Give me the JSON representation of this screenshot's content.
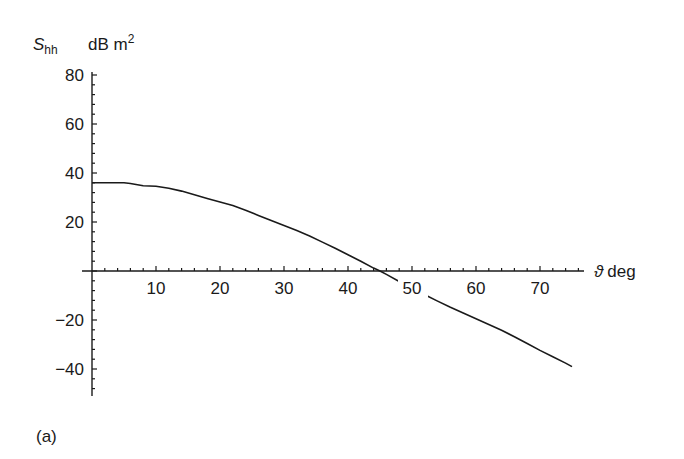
{
  "chart_data": {
    "type": "line",
    "title": "",
    "panel_label": "(a)",
    "xlabel": "ϑ deg",
    "xlabel_symbol": "ϑ",
    "xlabel_unit": "deg",
    "ylabel": "S_hh  dB m²",
    "ylabel_symbol": "S",
    "ylabel_subscript": "hh",
    "ylabel_unit": "dB m",
    "ylabel_unit_superscript": "2",
    "xlim": [
      0,
      77
    ],
    "ylim": [
      -50,
      80
    ],
    "xticks": [
      10,
      20,
      30,
      40,
      50,
      60,
      70
    ],
    "yticks": [
      80,
      60,
      40,
      20,
      -20,
      -40
    ],
    "xtick_labels": [
      "10",
      "20",
      "30",
      "40",
      "50",
      "60",
      "70"
    ],
    "ytick_labels": [
      "80",
      "60",
      "40",
      "20",
      "−20",
      "−40"
    ],
    "grid": false,
    "legend": null,
    "series": [
      {
        "name": "S_hh",
        "x": [
          0,
          2,
          4,
          5,
          6,
          8,
          10,
          12,
          14,
          16,
          18,
          20,
          22,
          24,
          26,
          28,
          30,
          32,
          34,
          36,
          38,
          40,
          42,
          44,
          45,
          46,
          48,
          50,
          52,
          54,
          56,
          58,
          60,
          62,
          64,
          66,
          68,
          70,
          72,
          74,
          75
        ],
        "values": [
          36,
          36,
          36,
          36,
          35.7,
          34.8,
          34.6,
          33.8,
          32.6,
          31.1,
          29.6,
          28.2,
          26.7,
          24.8,
          22.7,
          20.6,
          18.6,
          16.5,
          14.3,
          11.8,
          9.3,
          6.6,
          4.0,
          1.2,
          0,
          -1.4,
          -4.3,
          -7.0,
          -9.7,
          -12.3,
          -14.8,
          -17.2,
          -19.5,
          -21.8,
          -24.2,
          -26.8,
          -29.6,
          -32.4,
          -35.0,
          -37.6,
          -39.0
        ]
      }
    ]
  }
}
